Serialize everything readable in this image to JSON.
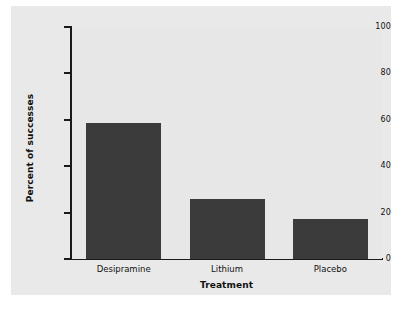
{
  "chart_data": {
    "type": "bar",
    "title": "",
    "subtitle": "",
    "xlabel": "Treatment",
    "ylabel": "Percent of successes",
    "categories": [
      "Desipramine",
      "Lithium",
      "Placebo"
    ],
    "values": [
      58.6,
      25.9,
      17.2
    ],
    "ylim": [
      0,
      100
    ],
    "yticks": [
      0,
      20,
      40,
      60,
      80,
      100
    ],
    "ytick_labels": [
      "0",
      "20",
      "40",
      "60",
      "80",
      "100"
    ],
    "grid": false,
    "legend": null,
    "bar_color": "#3b3b3b",
    "plot_background": "#e7e7e7",
    "figure_background": "#e9e9e9",
    "axis_color": "#1a1a1a"
  }
}
